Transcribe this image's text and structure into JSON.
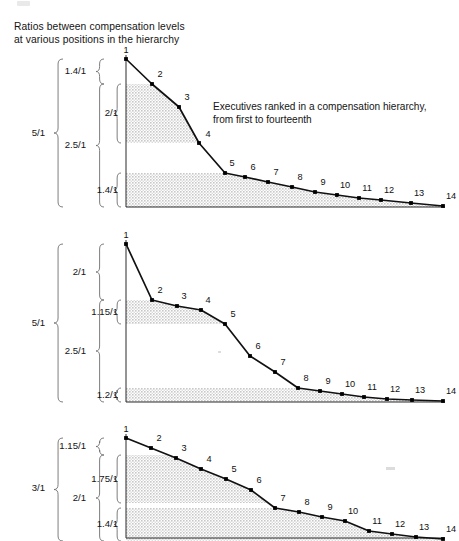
{
  "figure": {
    "title": "Ratios between compensation levels\nat various positions in the hierarchy",
    "annotation": "Executives ranked in a compensation hierarchy,\nfrom first to fourteenth",
    "point_labels": [
      "1",
      "2",
      "3",
      "4",
      "5",
      "6",
      "7",
      "8",
      "9",
      "10",
      "11",
      "12",
      "13",
      "14"
    ],
    "colors": {
      "line": "#111111",
      "marker": "#000000",
      "axis": "#2b2b2b",
      "band_fill": "#c8c8c8",
      "brace": "#6f6f6f",
      "text": "#141414"
    }
  },
  "chart_data": [
    {
      "id": "chart-1",
      "type": "line",
      "title": "Ratios between compensation levels at various positions in the hierarchy",
      "annotation": "Executives ranked in a compensation hierarchy, from first to fourteenth",
      "xlabel": "Executive rank (first to fourteenth)",
      "ylabel": "Relative compensation level",
      "categories": [
        "1",
        "2",
        "3",
        "4",
        "5",
        "6",
        "7",
        "8",
        "9",
        "10",
        "11",
        "12",
        "13",
        "14"
      ],
      "x": [
        1,
        2,
        3,
        4,
        5,
        6,
        7,
        8,
        9,
        10,
        11,
        12,
        13,
        14
      ],
      "values": [
        5.0,
        3.57,
        2.92,
        2.16,
        1.4,
        1.32,
        1.25,
        1.19,
        1.12,
        1.09,
        1.06,
        1.04,
        1.02,
        1.0
      ],
      "ylim": [
        0,
        5.0
      ],
      "grid": false,
      "legend": "none",
      "shaded_bands": [
        {
          "label": "2/1",
          "from_value": 2.16,
          "to_value": 3.57
        },
        {
          "label": "1.4/1",
          "from_value": 0.0,
          "to_value": 1.4
        }
      ],
      "braces": {
        "outer": {
          "label": "5/1",
          "from_value": 0.0,
          "to_value": 5.0
        },
        "inner": [
          {
            "label": "1.4/1",
            "from_value": 3.57,
            "to_value": 5.0
          },
          {
            "label": "2.5/1",
            "from_value": 0.0,
            "to_value": 3.57
          }
        ],
        "innermost": [
          {
            "label": "2/1",
            "from_value": 2.16,
            "to_value": 3.57
          },
          {
            "label": "1.4/1",
            "from_value": 0.0,
            "to_value": 1.4
          }
        ]
      }
    },
    {
      "id": "chart-2",
      "type": "line",
      "xlabel": "Executive rank (first to fourteenth)",
      "ylabel": "Relative compensation level",
      "categories": [
        "1",
        "2",
        "3",
        "4",
        "5",
        "6",
        "7",
        "8",
        "9",
        "10",
        "11",
        "12",
        "13",
        "14"
      ],
      "x": [
        1,
        2,
        3,
        4,
        5,
        6,
        7,
        8,
        9,
        10,
        11,
        12,
        13,
        14
      ],
      "values": [
        5.0,
        2.5,
        2.32,
        2.2,
        2.08,
        1.62,
        1.42,
        1.2,
        1.15,
        1.11,
        1.07,
        1.04,
        1.02,
        1.0
      ],
      "ylim": [
        0,
        5.0
      ],
      "grid": false,
      "legend": "none",
      "shaded_bands": [
        {
          "label": "1.15/1",
          "from_value": 2.08,
          "to_value": 2.5
        },
        {
          "label": "1.2/1",
          "from_value": 0.0,
          "to_value": 1.2
        }
      ],
      "braces": {
        "outer": {
          "label": "5/1",
          "from_value": 0.0,
          "to_value": 5.0
        },
        "inner": [
          {
            "label": "2/1",
            "from_value": 2.5,
            "to_value": 5.0
          },
          {
            "label": "2.5/1",
            "from_value": 0.0,
            "to_value": 2.5
          }
        ],
        "innermost": [
          {
            "label": "1.15/1",
            "from_value": 2.08,
            "to_value": 2.5
          },
          {
            "label": "1.2/1",
            "from_value": 0.0,
            "to_value": 1.2
          }
        ]
      }
    },
    {
      "id": "chart-3",
      "type": "line",
      "xlabel": "Executive rank (first to fourteenth)",
      "ylabel": "Relative compensation level",
      "categories": [
        "1",
        "2",
        "3",
        "4",
        "5",
        "6",
        "7",
        "8",
        "9",
        "10",
        "11",
        "12",
        "13",
        "14"
      ],
      "x": [
        1,
        2,
        3,
        4,
        5,
        6,
        7,
        8,
        9,
        10,
        11,
        12,
        13,
        14
      ],
      "values": [
        3.0,
        2.61,
        2.35,
        2.08,
        1.83,
        1.57,
        1.4,
        1.33,
        1.26,
        1.2,
        1.08,
        1.04,
        1.01,
        1.0
      ],
      "ylim": [
        0,
        3.0
      ],
      "grid": false,
      "legend": "none",
      "shaded_bands": [
        {
          "label": "1.75/1",
          "from_value": 1.4,
          "to_value": 2.61
        },
        {
          "label": "1.4/1",
          "from_value": 0.0,
          "to_value": 1.4
        }
      ],
      "braces": {
        "outer": {
          "label": "3/1",
          "from_value": 0.0,
          "to_value": 3.0
        },
        "inner": [
          {
            "label": "1.15/1",
            "from_value": 2.61,
            "to_value": 3.0
          },
          {
            "label": "2/1",
            "from_value": 0.0,
            "to_value": 2.61
          }
        ],
        "innermost": [
          {
            "label": "1.75/1",
            "from_value": 1.4,
            "to_value": 2.61
          },
          {
            "label": "1.4/1",
            "from_value": 0.0,
            "to_value": 1.4
          }
        ]
      }
    }
  ],
  "charts_render": [
    {
      "name": "chart-1",
      "top": 50,
      "height": 175,
      "axis_x": 126,
      "baseline_y": 157,
      "points": [
        {
          "x": 126,
          "y": 9
        },
        {
          "x": 152,
          "y": 34
        },
        {
          "x": 179,
          "y": 57
        },
        {
          "x": 199,
          "y": 93
        },
        {
          "x": 225,
          "y": 123
        },
        {
          "x": 245,
          "y": 127
        },
        {
          "x": 268,
          "y": 132
        },
        {
          "x": 292,
          "y": 137
        },
        {
          "x": 315,
          "y": 142
        },
        {
          "x": 337,
          "y": 145
        },
        {
          "x": 359,
          "y": 148
        },
        {
          "x": 381,
          "y": 150
        },
        {
          "x": 411,
          "y": 153
        },
        {
          "x": 443,
          "y": 156
        }
      ],
      "label_offsets": [
        {
          "dx": 0,
          "dy": -4
        },
        {
          "dx": 8,
          "dy": -5
        },
        {
          "dx": 8,
          "dy": -5
        },
        {
          "dx": 9,
          "dy": -4
        },
        {
          "dx": 7,
          "dy": -5
        },
        {
          "dx": 8,
          "dy": -5
        },
        {
          "dx": 8,
          "dy": -5
        },
        {
          "dx": 8,
          "dy": -5
        },
        {
          "dx": 8,
          "dy": -5
        },
        {
          "dx": 8,
          "dy": -5
        },
        {
          "dx": 8,
          "dy": -5
        },
        {
          "dx": 8,
          "dy": -5
        },
        {
          "dx": 8,
          "dy": -5
        },
        {
          "dx": 8,
          "dy": -5
        }
      ],
      "bands": [
        {
          "top": 34,
          "bottom": 93
        },
        {
          "top": 123,
          "bottom": 157
        }
      ],
      "note": {
        "left": 213,
        "top": 50
      },
      "braces": [
        {
          "label": "5/1",
          "label_x": 45,
          "label_y": 83,
          "x": 63,
          "top": 9,
          "bottom": 157,
          "w": 9
        },
        {
          "label": "1.4/1",
          "label_x": 86,
          "label_y": 21,
          "x": 104,
          "top": 9,
          "bottom": 34,
          "w": 8
        },
        {
          "label": "2.5/1",
          "label_x": 86,
          "label_y": 95,
          "x": 104,
          "top": 34,
          "bottom": 157,
          "w": 8
        },
        {
          "label": "2/1",
          "label_x": 118,
          "label_y": 63,
          "x": 121,
          "top": 34,
          "bottom": 93,
          "w": 7,
          "inner": true
        },
        {
          "label": "1.4/1",
          "label_x": 118,
          "label_y": 140,
          "x": 121,
          "top": 123,
          "bottom": 157,
          "w": 7,
          "inner": true
        }
      ]
    },
    {
      "name": "chart-2",
      "top": 238,
      "height": 170,
      "axis_x": 126,
      "baseline_y": 164,
      "points": [
        {
          "x": 126,
          "y": 6
        },
        {
          "x": 152,
          "y": 62
        },
        {
          "x": 177,
          "y": 68
        },
        {
          "x": 201,
          "y": 72
        },
        {
          "x": 225,
          "y": 86
        },
        {
          "x": 250,
          "y": 118
        },
        {
          "x": 275,
          "y": 134
        },
        {
          "x": 298,
          "y": 150
        },
        {
          "x": 320,
          "y": 153
        },
        {
          "x": 342,
          "y": 156
        },
        {
          "x": 364,
          "y": 159
        },
        {
          "x": 387,
          "y": 161
        },
        {
          "x": 412,
          "y": 162
        },
        {
          "x": 443,
          "y": 163
        }
      ],
      "label_offsets": [
        {
          "dx": 0,
          "dy": -4
        },
        {
          "dx": 8,
          "dy": -5
        },
        {
          "dx": 7,
          "dy": -5
        },
        {
          "dx": 7,
          "dy": -5
        },
        {
          "dx": 8,
          "dy": -5
        },
        {
          "dx": 8,
          "dy": -5
        },
        {
          "dx": 8,
          "dy": -5
        },
        {
          "dx": 8,
          "dy": -5
        },
        {
          "dx": 8,
          "dy": -5
        },
        {
          "dx": 8,
          "dy": -5
        },
        {
          "dx": 8,
          "dy": -5
        },
        {
          "dx": 8,
          "dy": -5
        },
        {
          "dx": 8,
          "dy": -5
        },
        {
          "dx": 8,
          "dy": -5
        }
      ],
      "bands": [
        {
          "top": 62,
          "bottom": 86
        },
        {
          "top": 150,
          "bottom": 164
        }
      ],
      "braces": [
        {
          "label": "5/1",
          "label_x": 45,
          "label_y": 85,
          "x": 63,
          "top": 6,
          "bottom": 164,
          "w": 9
        },
        {
          "label": "2/1",
          "label_x": 86,
          "label_y": 34,
          "x": 104,
          "top": 6,
          "bottom": 62,
          "w": 8
        },
        {
          "label": "2.5/1",
          "label_x": 86,
          "label_y": 113,
          "x": 104,
          "top": 62,
          "bottom": 164,
          "w": 8
        },
        {
          "label": "1.15/1",
          "label_x": 118,
          "label_y": 74,
          "x": 121,
          "top": 62,
          "bottom": 86,
          "w": 7,
          "inner": true
        },
        {
          "label": "1.2/1",
          "label_x": 118,
          "label_y": 157,
          "x": 121,
          "top": 150,
          "bottom": 164,
          "w": 7,
          "inner": true
        }
      ]
    },
    {
      "name": "chart-3",
      "top": 430,
      "height": 111,
      "axis_x": 126,
      "baseline_y": 108,
      "points": [
        {
          "x": 126,
          "y": 8
        },
        {
          "x": 151,
          "y": 18
        },
        {
          "x": 176,
          "y": 28
        },
        {
          "x": 201,
          "y": 39
        },
        {
          "x": 226,
          "y": 49
        },
        {
          "x": 251,
          "y": 60
        },
        {
          "x": 275,
          "y": 78
        },
        {
          "x": 299,
          "y": 82
        },
        {
          "x": 322,
          "y": 87
        },
        {
          "x": 345,
          "y": 91
        },
        {
          "x": 369,
          "y": 101
        },
        {
          "x": 392,
          "y": 104
        },
        {
          "x": 416,
          "y": 107
        },
        {
          "x": 443,
          "y": 109
        }
      ],
      "label_offsets": [
        {
          "dx": 0,
          "dy": -4
        },
        {
          "dx": 8,
          "dy": -5
        },
        {
          "dx": 8,
          "dy": -5
        },
        {
          "dx": 8,
          "dy": -5
        },
        {
          "dx": 8,
          "dy": -5
        },
        {
          "dx": 8,
          "dy": -5
        },
        {
          "dx": 8,
          "dy": -5
        },
        {
          "dx": 8,
          "dy": -5
        },
        {
          "dx": 8,
          "dy": -5
        },
        {
          "dx": 8,
          "dy": -5
        },
        {
          "dx": 8,
          "dy": -5
        },
        {
          "dx": 8,
          "dy": -5
        },
        {
          "dx": 8,
          "dy": -5
        },
        {
          "dx": 8,
          "dy": -5
        }
      ],
      "bands": [
        {
          "top": 25,
          "bottom": 73
        },
        {
          "top": 78,
          "bottom": 111
        }
      ],
      "braces": [
        {
          "label": "3/1",
          "label_x": 45,
          "label_y": 58,
          "x": 63,
          "top": 8,
          "bottom": 111,
          "w": 9
        },
        {
          "label": "1.15/1",
          "label_x": 86,
          "label_y": 16,
          "x": 104,
          "top": 8,
          "bottom": 25,
          "w": 8
        },
        {
          "label": "2/1",
          "label_x": 86,
          "label_y": 68,
          "x": 104,
          "top": 25,
          "bottom": 111,
          "w": 8
        },
        {
          "label": "1.75/1",
          "label_x": 118,
          "label_y": 49,
          "x": 121,
          "top": 25,
          "bottom": 73,
          "w": 7,
          "inner": true
        },
        {
          "label": "1.4/1",
          "label_x": 118,
          "label_y": 94,
          "x": 121,
          "top": 78,
          "bottom": 111,
          "w": 7,
          "inner": true
        }
      ]
    }
  ],
  "specks": [
    {
      "left": 338,
      "top": 196,
      "w": 3,
      "h": 2
    },
    {
      "left": 386,
      "top": 467,
      "w": 9,
      "h": 3
    },
    {
      "left": 218,
      "top": 351,
      "w": 3,
      "h": 2
    }
  ]
}
